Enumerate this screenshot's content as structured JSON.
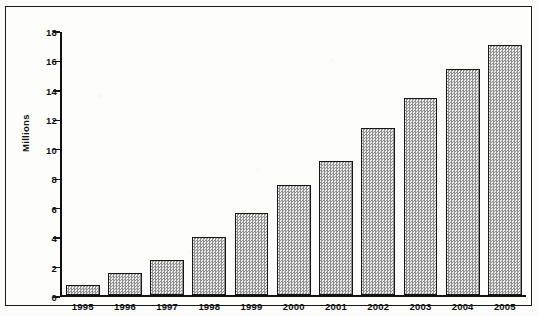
{
  "chart_data": {
    "type": "bar",
    "title": "",
    "xlabel": "",
    "ylabel": "Millions",
    "categories": [
      "1995",
      "1996",
      "1997",
      "1998",
      "1999",
      "2000",
      "2001",
      "2002",
      "2003",
      "2004",
      "2005"
    ],
    "values": [
      0.7,
      1.5,
      2.4,
      4.0,
      5.6,
      7.5,
      9.1,
      11.4,
      13.4,
      15.4,
      17.0
    ],
    "ylim": [
      0,
      18
    ],
    "ytick_step": 2,
    "yticks": [
      0,
      2,
      4,
      6,
      8,
      10,
      12,
      14,
      16,
      18
    ],
    "ytick_labels": [
      "0",
      "2",
      "4",
      "6",
      "8",
      "10",
      "12",
      "14",
      "16",
      "18"
    ],
    "grid": false,
    "legend": null,
    "series": [
      {
        "name": "Millions",
        "values": [
          0.7,
          1.5,
          2.4,
          4.0,
          5.6,
          7.5,
          9.1,
          11.4,
          13.4,
          15.4,
          17.0
        ],
        "fill": "#c9c9c9",
        "edge": "#171717",
        "pattern": "checkered-dither"
      }
    ]
  },
  "style": {
    "frame_color": "#1a1a1a",
    "axis_color": "#111111",
    "text_color": "#121212",
    "page_background": "#fdfdfc"
  }
}
